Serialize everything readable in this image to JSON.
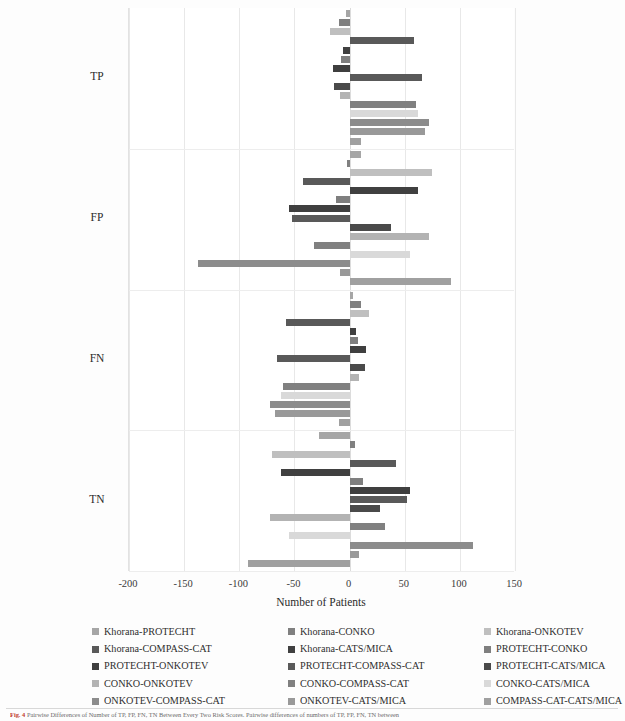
{
  "chart_data": {
    "type": "bar",
    "orientation": "horizontal",
    "title": "",
    "xlabel": "Number of Patients",
    "ylabel": "",
    "xlim": [
      -200,
      150
    ],
    "xticks": [
      -200,
      -150,
      -100,
      -50,
      0,
      50,
      100,
      150
    ],
    "xtick_labels": [
      "-200",
      "-150",
      "-100",
      "-50",
      "0",
      "50",
      "100",
      "150"
    ],
    "categories": [
      "TP",
      "FP",
      "FN",
      "TN"
    ],
    "grid": true,
    "legend_position": "bottom",
    "series": [
      {
        "name": "Khorana-PROTECHT",
        "color": "#a6a6a6",
        "values": [
          -3,
          10,
          3,
          -28
        ]
      },
      {
        "name": "Khorana-CONKO",
        "color": "#808080",
        "values": [
          -10,
          -2,
          10,
          5
        ]
      },
      {
        "name": "Khorana-ONKOTEV",
        "color": "#bfbfbf",
        "values": [
          -18,
          75,
          18,
          -70
        ]
      },
      {
        "name": "Khorana-COMPASS-CAT",
        "color": "#595959",
        "values": [
          58,
          -42,
          -58,
          42
        ]
      },
      {
        "name": "Khorana-CATS/MICA",
        "color": "#404040",
        "values": [
          -6,
          62,
          6,
          -62
        ]
      },
      {
        "name": "PROTECHT-CONKO",
        "color": "#7f7f7f",
        "values": [
          -8,
          -12,
          8,
          12
        ]
      },
      {
        "name": "PROTECHT-ONKOTEV",
        "color": "#3f3f3f",
        "values": [
          -15,
          -55,
          15,
          55
        ]
      },
      {
        "name": "PROTECHT-COMPASS-CAT",
        "color": "#595959",
        "values": [
          66,
          -52,
          -66,
          52
        ]
      },
      {
        "name": "PROTECHT-CATS/MICA",
        "color": "#4a4a4a",
        "values": [
          -14,
          38,
          14,
          28
        ]
      },
      {
        "name": "CONKO-ONKOTEV",
        "color": "#b3b3b3",
        "values": [
          -9,
          72,
          9,
          -72
        ]
      },
      {
        "name": "CONKO-COMPASS-CAT",
        "color": "#808080",
        "values": [
          60,
          -32,
          -60,
          32
        ]
      },
      {
        "name": "CONKO-CATS/MICA",
        "color": "#d9d9d9",
        "values": [
          62,
          55,
          -62,
          -55
        ]
      },
      {
        "name": "ONKOTEV-COMPASS-CAT",
        "color": "#8c8c8c",
        "values": [
          72,
          -137,
          -72,
          112
        ]
      },
      {
        "name": "ONKOTEV-CATS/MICA",
        "color": "#999999",
        "values": [
          68,
          -9,
          -68,
          9
        ]
      },
      {
        "name": "COMPASS-CAT-CATS/MICA",
        "color": "#a0a0a0",
        "values": [
          10,
          92,
          -10,
          -92
        ]
      }
    ]
  },
  "axis": {
    "x_title": "Number of Patients",
    "tick_labels": [
      "-200",
      "-150",
      "-100",
      "-50",
      "0",
      "50",
      "100",
      "150"
    ],
    "group_labels": [
      "TP",
      "FP",
      "FN",
      "TN"
    ]
  },
  "legend": {
    "items": [
      "Khorana-PROTECHT",
      "Khorana-CONKO",
      "Khorana-ONKOTEV",
      "Khorana-COMPASS-CAT",
      "Khorana-CATS/MICA",
      "PROTECHT-CONKO",
      "PROTECHT-ONKOTEV",
      "PROTECHT-COMPASS-CAT",
      "PROTECHT-CATS/MICA",
      "CONKO-ONKOTEV",
      "CONKO-COMPASS-CAT",
      "CONKO-CATS/MICA",
      "ONKOTEV-COMPASS-CAT",
      "ONKOTEV-CATS/MICA",
      "COMPASS-CAT-CATS/MICA"
    ]
  },
  "caption": {
    "label": "Fig. 4",
    "text": "Pairwise Differences of Number of TP, FP, FN, TN Between Every Two Risk Scores. Pairwise differences of numbers of TP, FP, FN, TN between"
  }
}
